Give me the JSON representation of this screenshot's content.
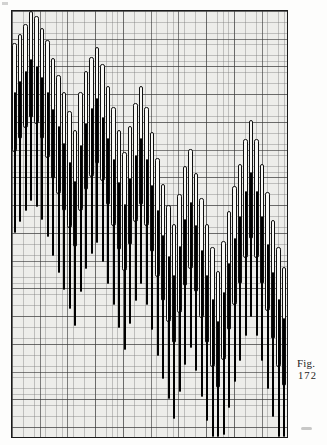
{
  "figure": {
    "caption_label": "Fig.",
    "caption_number": "172",
    "background_color": "#ededea",
    "frame_color": "#1a1a1a",
    "bar_open_fill": "#f7f7f4",
    "bar_filled_fill": "#111111",
    "grid_minor_color": "#787878",
    "grid_major_color": "#373737"
  },
  "chart_data": {
    "type": "bar",
    "title": "Fig. 172",
    "subtitle": "",
    "xlabel": "",
    "ylabel": "",
    "grid": true,
    "legend_position": "none",
    "x": [
      0,
      1,
      2,
      3,
      4,
      5,
      6,
      7,
      8,
      9,
      10,
      11,
      12,
      13,
      14,
      15,
      16,
      17,
      18,
      19,
      20,
      21,
      22,
      23,
      24,
      25,
      26,
      27,
      28,
      29,
      30,
      31,
      32,
      33,
      34,
      35,
      36,
      37,
      38,
      39,
      40,
      41,
      42,
      43,
      44,
      45,
      46,
      47,
      48,
      49
    ],
    "series": [
      {
        "name": "open-bars",
        "style": "outlined-white",
        "bars": [
          {
            "x": 0,
            "top": 0.075,
            "bottom": 0.33
          },
          {
            "x": 1,
            "top": 0.055,
            "bottom": 0.3
          },
          {
            "x": 2,
            "top": 0.03,
            "bottom": 0.275
          },
          {
            "x": 3,
            "top": 0.0,
            "bottom": 0.25
          },
          {
            "x": 4,
            "top": 0.012,
            "bottom": 0.265
          },
          {
            "x": 5,
            "top": 0.04,
            "bottom": 0.3
          },
          {
            "x": 6,
            "top": 0.068,
            "bottom": 0.345
          },
          {
            "x": 7,
            "top": 0.11,
            "bottom": 0.395
          },
          {
            "x": 8,
            "top": 0.15,
            "bottom": 0.43
          },
          {
            "x": 9,
            "top": 0.19,
            "bottom": 0.47
          },
          {
            "x": 10,
            "top": 0.235,
            "bottom": 0.51
          },
          {
            "x": 11,
            "top": 0.28,
            "bottom": 0.555
          },
          {
            "x": 12,
            "top": 0.19,
            "bottom": 0.47
          },
          {
            "x": 13,
            "top": 0.14,
            "bottom": 0.42
          },
          {
            "x": 14,
            "top": 0.108,
            "bottom": 0.39
          },
          {
            "x": 15,
            "top": 0.085,
            "bottom": 0.36
          },
          {
            "x": 16,
            "top": 0.125,
            "bottom": 0.4
          },
          {
            "x": 17,
            "top": 0.175,
            "bottom": 0.455
          },
          {
            "x": 18,
            "top": 0.225,
            "bottom": 0.505
          },
          {
            "x": 19,
            "top": 0.28,
            "bottom": 0.56
          },
          {
            "x": 20,
            "top": 0.33,
            "bottom": 0.61
          },
          {
            "x": 21,
            "top": 0.27,
            "bottom": 0.55
          },
          {
            "x": 22,
            "top": 0.215,
            "bottom": 0.495
          },
          {
            "x": 23,
            "top": 0.175,
            "bottom": 0.455
          },
          {
            "x": 24,
            "top": 0.225,
            "bottom": 0.505
          },
          {
            "x": 25,
            "top": 0.285,
            "bottom": 0.565
          },
          {
            "x": 26,
            "top": 0.345,
            "bottom": 0.625
          },
          {
            "x": 27,
            "top": 0.405,
            "bottom": 0.68
          },
          {
            "x": 28,
            "top": 0.455,
            "bottom": 0.73
          },
          {
            "x": 29,
            "top": 0.5,
            "bottom": 0.78
          },
          {
            "x": 30,
            "top": 0.43,
            "bottom": 0.71
          },
          {
            "x": 31,
            "top": 0.365,
            "bottom": 0.645
          },
          {
            "x": 32,
            "top": 0.325,
            "bottom": 0.605
          },
          {
            "x": 33,
            "top": 0.38,
            "bottom": 0.66
          },
          {
            "x": 34,
            "top": 0.44,
            "bottom": 0.72
          },
          {
            "x": 35,
            "top": 0.5,
            "bottom": 0.78
          },
          {
            "x": 36,
            "top": 0.555,
            "bottom": 0.835
          },
          {
            "x": 37,
            "top": 0.61,
            "bottom": 0.885
          },
          {
            "x": 38,
            "top": 0.54,
            "bottom": 0.82
          },
          {
            "x": 39,
            "top": 0.47,
            "bottom": 0.75
          },
          {
            "x": 40,
            "top": 0.41,
            "bottom": 0.69
          },
          {
            "x": 41,
            "top": 0.36,
            "bottom": 0.64
          },
          {
            "x": 42,
            "top": 0.3,
            "bottom": 0.58
          },
          {
            "x": 43,
            "top": 0.255,
            "bottom": 0.535
          },
          {
            "x": 44,
            "top": 0.3,
            "bottom": 0.58
          },
          {
            "x": 45,
            "top": 0.36,
            "bottom": 0.64
          },
          {
            "x": 46,
            "top": 0.425,
            "bottom": 0.705
          },
          {
            "x": 47,
            "top": 0.49,
            "bottom": 0.77
          },
          {
            "x": 48,
            "top": 0.555,
            "bottom": 0.835
          },
          {
            "x": 49,
            "top": 0.6,
            "bottom": 0.88
          }
        ]
      },
      {
        "name": "filled-bars",
        "style": "solid-black",
        "bars": [
          {
            "x": 0,
            "top": 0.19,
            "bottom": 0.52
          },
          {
            "x": 1,
            "top": 0.165,
            "bottom": 0.495
          },
          {
            "x": 2,
            "top": 0.14,
            "bottom": 0.47
          },
          {
            "x": 3,
            "top": 0.112,
            "bottom": 0.445
          },
          {
            "x": 4,
            "top": 0.128,
            "bottom": 0.46
          },
          {
            "x": 5,
            "top": 0.155,
            "bottom": 0.49
          },
          {
            "x": 6,
            "top": 0.19,
            "bottom": 0.53
          },
          {
            "x": 7,
            "top": 0.23,
            "bottom": 0.575
          },
          {
            "x": 8,
            "top": 0.27,
            "bottom": 0.615
          },
          {
            "x": 9,
            "top": 0.31,
            "bottom": 0.655
          },
          {
            "x": 10,
            "top": 0.355,
            "bottom": 0.7
          },
          {
            "x": 11,
            "top": 0.4,
            "bottom": 0.74
          },
          {
            "x": 12,
            "top": 0.315,
            "bottom": 0.66
          },
          {
            "x": 13,
            "top": 0.262,
            "bottom": 0.605
          },
          {
            "x": 14,
            "top": 0.228,
            "bottom": 0.57
          },
          {
            "x": 15,
            "top": 0.205,
            "bottom": 0.545
          },
          {
            "x": 16,
            "top": 0.248,
            "bottom": 0.59
          },
          {
            "x": 17,
            "top": 0.298,
            "bottom": 0.64
          },
          {
            "x": 18,
            "top": 0.348,
            "bottom": 0.69
          },
          {
            "x": 19,
            "top": 0.402,
            "bottom": 0.745
          },
          {
            "x": 20,
            "top": 0.452,
            "bottom": 0.795
          },
          {
            "x": 21,
            "top": 0.392,
            "bottom": 0.735
          },
          {
            "x": 22,
            "top": 0.338,
            "bottom": 0.68
          },
          {
            "x": 23,
            "top": 0.298,
            "bottom": 0.64
          },
          {
            "x": 24,
            "top": 0.348,
            "bottom": 0.69
          },
          {
            "x": 25,
            "top": 0.408,
            "bottom": 0.75
          },
          {
            "x": 26,
            "top": 0.468,
            "bottom": 0.81
          },
          {
            "x": 27,
            "top": 0.525,
            "bottom": 0.865
          },
          {
            "x": 28,
            "top": 0.575,
            "bottom": 0.912
          },
          {
            "x": 29,
            "top": 0.62,
            "bottom": 0.958
          },
          {
            "x": 30,
            "top": 0.552,
            "bottom": 0.895
          },
          {
            "x": 31,
            "top": 0.488,
            "bottom": 0.83
          },
          {
            "x": 32,
            "top": 0.448,
            "bottom": 0.79
          },
          {
            "x": 33,
            "top": 0.502,
            "bottom": 0.845
          },
          {
            "x": 34,
            "top": 0.562,
            "bottom": 0.905
          },
          {
            "x": 35,
            "top": 0.62,
            "bottom": 0.962
          },
          {
            "x": 36,
            "top": 0.675,
            "bottom": 1.0
          },
          {
            "x": 37,
            "top": 0.728,
            "bottom": 1.0
          },
          {
            "x": 38,
            "top": 0.66,
            "bottom": 0.995
          },
          {
            "x": 39,
            "top": 0.592,
            "bottom": 0.932
          },
          {
            "x": 40,
            "top": 0.532,
            "bottom": 0.872
          },
          {
            "x": 41,
            "top": 0.482,
            "bottom": 0.822
          },
          {
            "x": 42,
            "top": 0.422,
            "bottom": 0.762
          },
          {
            "x": 43,
            "top": 0.378,
            "bottom": 0.718
          },
          {
            "x": 44,
            "top": 0.422,
            "bottom": 0.762
          },
          {
            "x": 45,
            "top": 0.482,
            "bottom": 0.822
          },
          {
            "x": 46,
            "top": 0.548,
            "bottom": 0.888
          },
          {
            "x": 47,
            "top": 0.612,
            "bottom": 0.952
          },
          {
            "x": 48,
            "top": 0.675,
            "bottom": 1.0
          },
          {
            "x": 49,
            "top": 0.72,
            "bottom": 1.0
          }
        ]
      }
    ],
    "xlim": [
      0,
      50
    ],
    "ylim": [
      0,
      1
    ]
  }
}
